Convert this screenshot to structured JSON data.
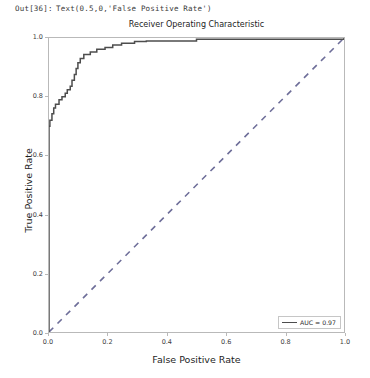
{
  "notebook": {
    "prompt": "Out[36]:",
    "output_text": "Text(0.5,0,'False Positive Rate')"
  },
  "chart_data": {
    "type": "line",
    "title": "Receiver Operating Characteristic",
    "xlabel": "False Positive Rate",
    "ylabel": "True Positive Rate",
    "xlim": [
      0.0,
      1.0
    ],
    "ylim": [
      0.0,
      1.0
    ],
    "xticks": [
      "0.0",
      "0.2",
      "0.4",
      "0.6",
      "0.8",
      "1.0"
    ],
    "xtick_values": [
      0.0,
      0.2,
      0.4,
      0.6,
      0.8,
      1.0
    ],
    "yticks": [
      "0.0",
      "0.2",
      "0.4",
      "0.6",
      "0.8",
      "1.0"
    ],
    "ytick_values": [
      0.0,
      0.2,
      0.4,
      0.6,
      0.8,
      1.0
    ],
    "grid": false,
    "legend_position": "lower right",
    "series": [
      {
        "name": "AUC = 0.97",
        "style": "solid",
        "color": "#4d4d4d",
        "points": [
          [
            0.0,
            0.0
          ],
          [
            0.0,
            0.7
          ],
          [
            0.003,
            0.7
          ],
          [
            0.003,
            0.72
          ],
          [
            0.01,
            0.72
          ],
          [
            0.01,
            0.742
          ],
          [
            0.016,
            0.742
          ],
          [
            0.016,
            0.762
          ],
          [
            0.022,
            0.762
          ],
          [
            0.022,
            0.775
          ],
          [
            0.034,
            0.775
          ],
          [
            0.034,
            0.79
          ],
          [
            0.044,
            0.79
          ],
          [
            0.044,
            0.8
          ],
          [
            0.055,
            0.8
          ],
          [
            0.055,
            0.812
          ],
          [
            0.062,
            0.812
          ],
          [
            0.062,
            0.824
          ],
          [
            0.072,
            0.824
          ],
          [
            0.072,
            0.836
          ],
          [
            0.078,
            0.836
          ],
          [
            0.078,
            0.856
          ],
          [
            0.086,
            0.856
          ],
          [
            0.086,
            0.876
          ],
          [
            0.092,
            0.876
          ],
          [
            0.092,
            0.896
          ],
          [
            0.098,
            0.896
          ],
          [
            0.098,
            0.916
          ],
          [
            0.106,
            0.916
          ],
          [
            0.106,
            0.93
          ],
          [
            0.118,
            0.93
          ],
          [
            0.118,
            0.944
          ],
          [
            0.14,
            0.944
          ],
          [
            0.14,
            0.952
          ],
          [
            0.162,
            0.952
          ],
          [
            0.162,
            0.962
          ],
          [
            0.19,
            0.962
          ],
          [
            0.19,
            0.968
          ],
          [
            0.216,
            0.968
          ],
          [
            0.216,
            0.976
          ],
          [
            0.246,
            0.976
          ],
          [
            0.246,
            0.982
          ],
          [
            0.29,
            0.982
          ],
          [
            0.29,
            0.988
          ],
          [
            0.33,
            0.988
          ],
          [
            0.33,
            0.99
          ],
          [
            0.5,
            0.99
          ],
          [
            0.5,
            0.996
          ],
          [
            1.0,
            0.996
          ],
          [
            1.0,
            1.0
          ]
        ]
      },
      {
        "name": "chance",
        "style": "dashed",
        "color": "#6e6e99",
        "points": [
          [
            0.0,
            0.0
          ],
          [
            1.0,
            1.0
          ]
        ]
      }
    ],
    "legend": [
      {
        "label": "AUC = 0.97",
        "style": "solid",
        "color": "#4d4d4d"
      }
    ]
  }
}
